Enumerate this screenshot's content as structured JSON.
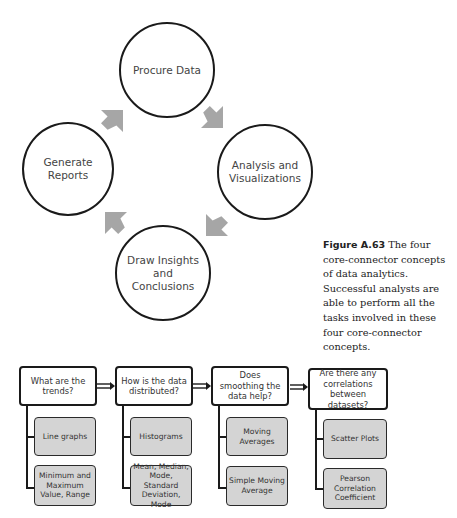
{
  "cycle_diagram": {
    "nodes": [
      {
        "id": "procure",
        "label": "Procure Data"
      },
      {
        "id": "analysis",
        "label": "Analysis and Visualizations"
      },
      {
        "id": "insights",
        "label": "Draw Insights and Conclusions"
      },
      {
        "id": "reports",
        "label": "Generate Reports"
      }
    ],
    "arrow_color": "#a6a6a6",
    "flow": [
      "Procure Data",
      "Analysis and Visualizations",
      "Draw Insights and Conclusions",
      "Generate Reports",
      "Procure Data"
    ]
  },
  "caption": {
    "figure_label": "Figure A.63",
    "text": "The four core-connector concepts of data analytics. Successful analysts are able to perform all the tasks involved in these four core-connector concepts."
  },
  "flowchart": {
    "columns": [
      {
        "question": "What are the trends?",
        "answers": [
          "Line graphs",
          "Minimum and Maximum Value, Range"
        ]
      },
      {
        "question": "How is the data distributed?",
        "answers": [
          "Histograms",
          "Mean, Median, Mode, Standard Deviation, Mode"
        ]
      },
      {
        "question": "Does smoothing the data help?",
        "answers": [
          "Moving Averages",
          "Simple Moving Average"
        ]
      },
      {
        "question": "Are there any correlations between datasets?",
        "answers": [
          "Scatter Plots",
          "Pearson Correlation Coefficient"
        ]
      }
    ],
    "answer_box_color": "#d4d4d4"
  }
}
